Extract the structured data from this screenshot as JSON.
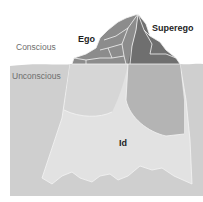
{
  "diagram": {
    "labels": {
      "conscious": "Conscious",
      "unconscious": "Unconscious",
      "ego": "Ego",
      "superego": "Superego",
      "id": "Id"
    },
    "colors": {
      "background": "#ffffff",
      "water": "#cfcfcf",
      "id_region": "#e2e2e2",
      "ego_underwater": "#d6d6d6",
      "superego_underwater": "#b4b4b4",
      "ego_above": "#8c8c8c",
      "superego_above": "#6f6f6f",
      "peak_light": "#a3a3a3",
      "outline": "#f4f4f4"
    }
  }
}
